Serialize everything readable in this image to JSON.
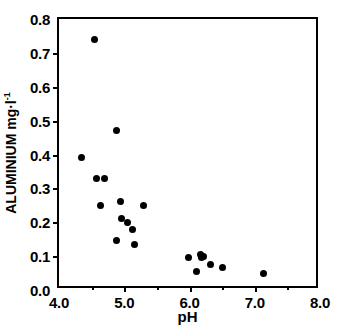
{
  "chart_data": {
    "type": "scatter",
    "title": "",
    "xlabel": "pH",
    "ylabel": "ALUMINIUM mg·l",
    "ylabel_exponent": "-1",
    "xlim": [
      4.0,
      8.0
    ],
    "ylim": [
      0.0,
      0.8
    ],
    "xticks": [
      4.0,
      5.0,
      6.0,
      7.0,
      8.0
    ],
    "xtick_labels": [
      "4.0",
      "5.0",
      "6.0",
      "7.0",
      "8.0"
    ],
    "xminor_ticks": [
      4.5,
      5.5,
      6.5,
      7.5
    ],
    "yticks": [
      0.0,
      0.1,
      0.2,
      0.3,
      0.4,
      0.5,
      0.6,
      0.7,
      0.8
    ],
    "ytick_labels": [
      "0.0",
      "0.1",
      "0.2",
      "0.3",
      "0.4",
      "0.5",
      "0.6",
      "0.7",
      "0.8"
    ],
    "grid": false,
    "legend": false,
    "marker": "filled-circle",
    "marker_color": "#000000",
    "points": [
      {
        "x": 4.54,
        "y": 0.74
      },
      {
        "x": 4.35,
        "y": 0.39
      },
      {
        "x": 4.58,
        "y": 0.33
      },
      {
        "x": 4.7,
        "y": 0.33
      },
      {
        "x": 4.88,
        "y": 0.47
      },
      {
        "x": 4.64,
        "y": 0.25
      },
      {
        "x": 4.94,
        "y": 0.26
      },
      {
        "x": 5.3,
        "y": 0.25
      },
      {
        "x": 4.96,
        "y": 0.21
      },
      {
        "x": 5.05,
        "y": 0.2
      },
      {
        "x": 5.12,
        "y": 0.18
      },
      {
        "x": 4.88,
        "y": 0.145
      },
      {
        "x": 5.15,
        "y": 0.135
      },
      {
        "x": 5.99,
        "y": 0.095
      },
      {
        "x": 6.17,
        "y": 0.105
      },
      {
        "x": 6.19,
        "y": 0.095
      },
      {
        "x": 6.32,
        "y": 0.075
      },
      {
        "x": 6.1,
        "y": 0.055
      },
      {
        "x": 6.5,
        "y": 0.065
      },
      {
        "x": 7.13,
        "y": 0.05
      },
      {
        "x": 6.22,
        "y": 0.1
      }
    ]
  },
  "axes": {
    "x_title": "pH",
    "y_title_main": "ALUMINIUM  mg·l",
    "y_title_sup": "-1"
  },
  "caption": {
    "sliver": ""
  }
}
